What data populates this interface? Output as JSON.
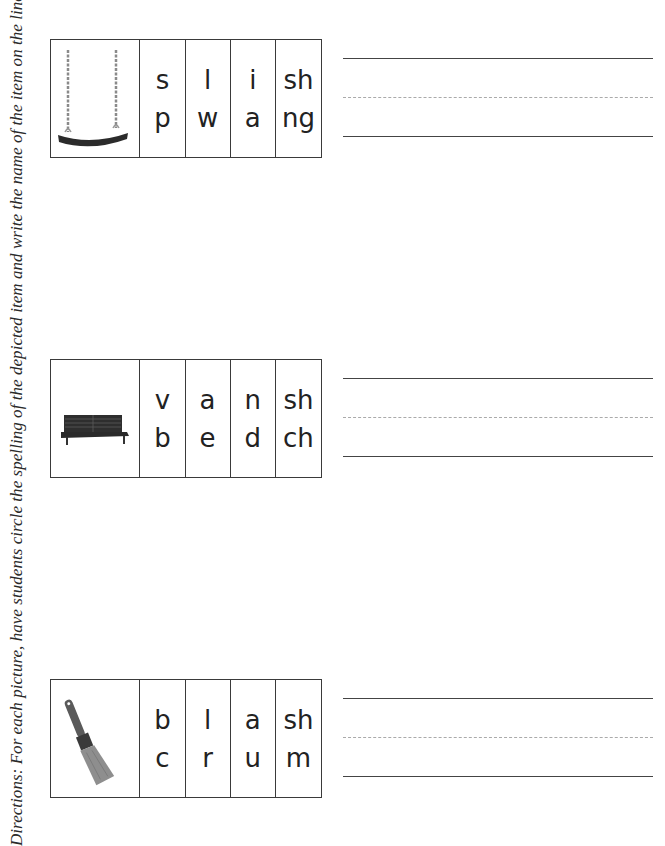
{
  "directions": "Directions: For each picture, have students circle the spelling of the depicted item and write the name of the item on the line.",
  "items": [
    {
      "picture": "swing",
      "columns": [
        {
          "top": "s",
          "bottom": "p"
        },
        {
          "top": "l",
          "bottom": "w"
        },
        {
          "top": "i",
          "bottom": "a"
        },
        {
          "top": "sh",
          "bottom": "ng"
        }
      ]
    },
    {
      "picture": "bench",
      "columns": [
        {
          "top": "v",
          "bottom": "b"
        },
        {
          "top": "a",
          "bottom": "e"
        },
        {
          "top": "n",
          "bottom": "d"
        },
        {
          "top": "sh",
          "bottom": "ch"
        }
      ]
    },
    {
      "picture": "paintbrush",
      "columns": [
        {
          "top": "b",
          "bottom": "c"
        },
        {
          "top": "l",
          "bottom": "r"
        },
        {
          "top": "a",
          "bottom": "u"
        },
        {
          "top": "sh",
          "bottom": "m"
        }
      ]
    }
  ],
  "colors": {
    "border": "#3a3a3a",
    "solid_line": "#444444",
    "dashed_line": "#aaaaaa",
    "text": "#222222"
  }
}
